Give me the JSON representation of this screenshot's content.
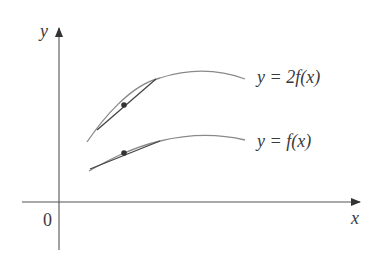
{
  "diagram": {
    "axes": {
      "x_label": "x",
      "y_label": "y",
      "origin_label": "0"
    },
    "curves": [
      {
        "name": "upper",
        "label_prefix": "y = 2",
        "label_f": "f",
        "label_arg": "(x)",
        "label": "y = 2f(x)"
      },
      {
        "name": "lower",
        "label_prefix": "y = ",
        "label_f": "f",
        "label_arg": "(x)",
        "label": "y = f(x)"
      }
    ],
    "colors": {
      "curve": "#8a8a8a",
      "tangent": "#444444",
      "axis": "#555555",
      "text": "#3a3a3a"
    }
  }
}
